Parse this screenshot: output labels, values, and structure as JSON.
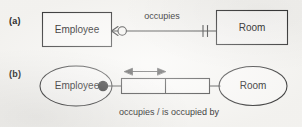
{
  "figure": {
    "background_color": "#f7f6f3",
    "ink_color": "#3a3a3a"
  },
  "panels": [
    {
      "label": "(a)",
      "notation": "crows-foot",
      "entities": [
        {
          "name": "Employee",
          "shape": "rectangle"
        },
        {
          "name": "Room",
          "shape": "rectangle"
        }
      ],
      "relationship": {
        "label": "occupies",
        "from_cardinality": "zero-or-many",
        "to_cardinality": "exactly-one"
      }
    },
    {
      "label": "(b)",
      "notation": "ellipse-relationship-box",
      "entities": [
        {
          "name": "Employee",
          "shape": "ellipse"
        },
        {
          "name": "Room",
          "shape": "ellipse"
        }
      ],
      "relationship": {
        "label": "occupies / is occupied by",
        "from_marker": "filled-circle",
        "to_marker": "plain-line",
        "box_cells": 2,
        "arrow": "double-headed"
      }
    }
  ]
}
